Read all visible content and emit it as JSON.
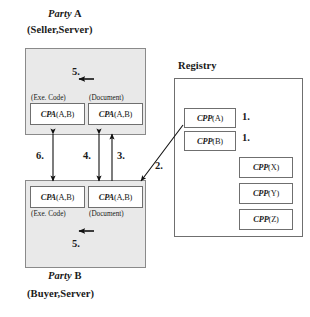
{
  "diagram": {
    "title_party_a_line1_italic": "Party",
    "title_party_a_line1_roman": "A",
    "title_party_a_line2": "(Seller,Server)",
    "title_party_b_line1_italic": "Party",
    "title_party_b_line1_roman": "B",
    "title_party_b_line2": "(Buyer,Server)",
    "title_registry": "Registry"
  },
  "party_a": {
    "exe_label": "(Exe. Code)",
    "doc_label": "(Document)",
    "exe_box_italic": "CPA",
    "exe_box_roman": "(A,B)",
    "doc_box_italic": "CPA",
    "doc_box_roman": "(A,B)",
    "internal_step": "5."
  },
  "party_b": {
    "exe_label": "(Exe. Code)",
    "doc_label": "(Document)",
    "exe_box_italic": "CPA",
    "exe_box_roman": "(A,B)",
    "doc_box_italic": "CPA",
    "doc_box_roman": "(A,B)",
    "internal_step": "5."
  },
  "registry": {
    "items": [
      {
        "italic": "CPP",
        "roman": "(A)",
        "step": "1."
      },
      {
        "italic": "CPP",
        "roman": "(B)",
        "step": "1."
      },
      {
        "italic": "CPP",
        "roman": "(X)",
        "step": ""
      },
      {
        "italic": "CPP",
        "roman": "(Y)",
        "step": ""
      },
      {
        "italic": "CPP",
        "roman": "(Z)",
        "step": ""
      }
    ]
  },
  "steps": {
    "s2": "2.",
    "s3": "3.",
    "s4": "4.",
    "s6": "6."
  },
  "colors": {
    "panel_fill": "#e9e9e9",
    "panel_stroke": "#8a8a8a",
    "box_stroke": "#6f6f6f",
    "arrow": "#111111",
    "text": "#1a1a1a"
  }
}
